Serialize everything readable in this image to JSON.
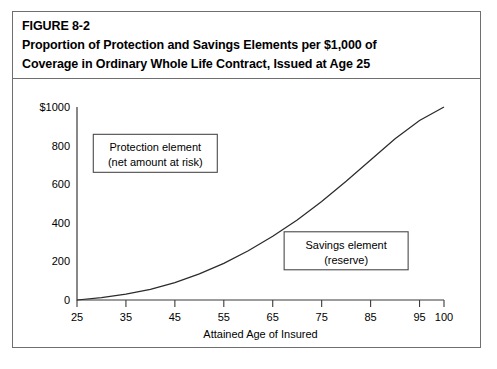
{
  "figure": {
    "label": "FIGURE 8-2",
    "title_line1": "Proportion of Protection and Savings Elements per $1,000 of",
    "title_line2": "Coverage in Ordinary Whole Life Contract, Issued at Age 25"
  },
  "chart_data": {
    "type": "line",
    "title": "Proportion of Protection and Savings Elements per $1,000 of Coverage in Ordinary Whole Life Contract, Issued at Age 25",
    "xlabel": "Attained Age of Insured",
    "ylabel": "",
    "xlim": [
      25,
      100
    ],
    "ylim": [
      0,
      1000
    ],
    "grid": false,
    "legend": "none",
    "xticks": [
      25,
      35,
      45,
      55,
      65,
      75,
      85,
      95,
      100
    ],
    "xtick_labels": [
      "25",
      "35",
      "45",
      "55",
      "65",
      "75",
      "85",
      "95",
      "100"
    ],
    "yticks": [
      0,
      200,
      400,
      600,
      800,
      1000
    ],
    "ytick_labels": [
      "0",
      "200",
      "400",
      "600",
      "800",
      "$1000"
    ],
    "series": [
      {
        "name": "Reserve (savings element)",
        "x": [
          25,
          30,
          35,
          40,
          45,
          50,
          55,
          60,
          65,
          70,
          75,
          80,
          85,
          90,
          95,
          100
        ],
        "values": [
          0,
          12,
          30,
          55,
          90,
          135,
          190,
          255,
          330,
          415,
          510,
          615,
          725,
          835,
          930,
          1000
        ]
      }
    ],
    "annotations": [
      {
        "name": "protection-element",
        "line1": "Protection element",
        "line2": "(net amount at risk)",
        "x": 41,
        "y": 760
      },
      {
        "name": "savings-element",
        "line1": "Savings element",
        "line2": "(reserve)",
        "x": 80,
        "y": 255
      }
    ]
  }
}
